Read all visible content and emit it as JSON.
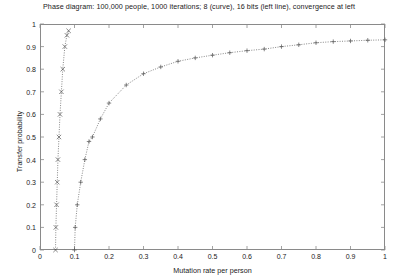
{
  "chart_data": {
    "type": "line",
    "title": "Phase diagram: 100,000 people, 1000 iterations; 8 (curve), 16 bits (left line), convergence at left",
    "xlabel": "Mutation rate per person",
    "ylabel": "Transfer probability",
    "xlim": [
      0,
      1
    ],
    "ylim": [
      0,
      1
    ],
    "grid": false,
    "legend": "none",
    "xticks": [
      "0",
      "0.1",
      "0.2",
      "0.3",
      "0.4",
      "0.5",
      "0.6",
      "0.7",
      "0.8",
      "0.9",
      "1"
    ],
    "xtick_values": [
      0,
      0.1,
      0.2,
      0.3,
      0.4,
      0.5,
      0.6,
      0.7,
      0.8,
      0.9,
      1
    ],
    "yticks": [
      "0",
      "0.1",
      "0.2",
      "0.3",
      "0.4",
      "0.5",
      "0.6",
      "0.7",
      "0.8",
      "0.9",
      "1"
    ],
    "ytick_values": [
      0,
      0.1,
      0.2,
      0.3,
      0.4,
      0.5,
      0.6,
      0.7,
      0.8,
      0.9,
      1
    ],
    "series": [
      {
        "name": "16 bits (left line)",
        "marker": "x",
        "linestyle": "dotted",
        "color": "#555555",
        "points": [
          [
            0.045,
            0.0
          ],
          [
            0.046,
            0.1
          ],
          [
            0.048,
            0.2
          ],
          [
            0.05,
            0.3
          ],
          [
            0.052,
            0.4
          ],
          [
            0.055,
            0.5
          ],
          [
            0.058,
            0.6
          ],
          [
            0.062,
            0.7
          ],
          [
            0.066,
            0.8
          ],
          [
            0.072,
            0.9
          ],
          [
            0.078,
            0.95
          ],
          [
            0.083,
            0.97
          ]
        ]
      },
      {
        "name": "8 bits (curve)",
        "marker": "+",
        "linestyle": "dotted",
        "color": "#555555",
        "points": [
          [
            0.1,
            0.0
          ],
          [
            0.102,
            0.1
          ],
          [
            0.108,
            0.2
          ],
          [
            0.118,
            0.3
          ],
          [
            0.13,
            0.4
          ],
          [
            0.142,
            0.48
          ],
          [
            0.152,
            0.5
          ],
          [
            0.175,
            0.58
          ],
          [
            0.2,
            0.65
          ],
          [
            0.25,
            0.73
          ],
          [
            0.3,
            0.78
          ],
          [
            0.35,
            0.81
          ],
          [
            0.4,
            0.835
          ],
          [
            0.45,
            0.85
          ],
          [
            0.5,
            0.862
          ],
          [
            0.55,
            0.873
          ],
          [
            0.6,
            0.882
          ],
          [
            0.65,
            0.889
          ],
          [
            0.7,
            0.9
          ],
          [
            0.75,
            0.908
          ],
          [
            0.8,
            0.917
          ],
          [
            0.85,
            0.922
          ],
          [
            0.9,
            0.925
          ],
          [
            0.95,
            0.928
          ],
          [
            1.0,
            0.93
          ]
        ]
      }
    ]
  }
}
